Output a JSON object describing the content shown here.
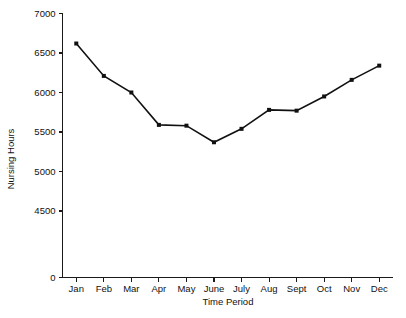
{
  "chart_data": {
    "type": "line",
    "title": "",
    "xlabel": "Time Period",
    "ylabel": "Nursing Hours",
    "categories": [
      "Jan",
      "Feb",
      "Mar",
      "Apr",
      "May",
      "June",
      "July",
      "Aug",
      "Sept",
      "Oct",
      "Nov",
      "Dec"
    ],
    "values": [
      6620,
      6210,
      6000,
      5590,
      5580,
      5370,
      5540,
      5780,
      5770,
      5950,
      6160,
      6340
    ],
    "series": [
      {
        "name": "Nursing Hours",
        "values": [
          6620,
          6210,
          6000,
          5590,
          5580,
          5370,
          5540,
          5780,
          5770,
          5950,
          6160,
          6340
        ]
      }
    ],
    "ytick_labels": [
      "0",
      "4500",
      "5000",
      "5500",
      "6000",
      "6500",
      "7000"
    ],
    "ytick_values": [
      0,
      4500,
      5000,
      5500,
      6000,
      6500,
      7000
    ],
    "ylim": [
      0,
      7000
    ],
    "y_axis_break": true,
    "grid": false,
    "legend": false,
    "marker": "square",
    "line_color": "#111111",
    "marker_color": "#111111",
    "background_color": "#ffffff"
  },
  "axes": {
    "y_title": "Nursing Hours",
    "x_title": "Time Period"
  }
}
